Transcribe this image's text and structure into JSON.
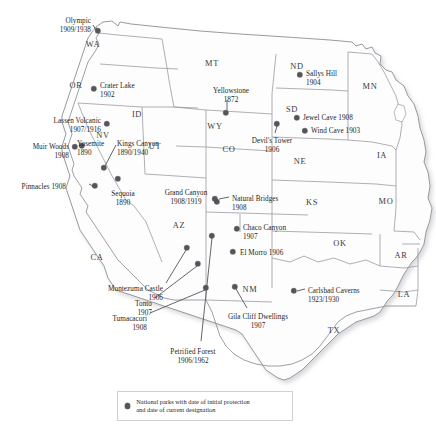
{
  "map": {
    "title": "National parks with date of initial protection and date of current designation",
    "colors": {
      "dot": "#55545a",
      "state_border": "#9a9aa2",
      "coast": "#8e8e96",
      "shadow": "#d8d8dc",
      "land": "#fdfdfd",
      "text": "#221f26"
    }
  },
  "legend": {
    "line1": "National parks with date of initial protection",
    "line2": "and date of current designation",
    "marker": "filled-circle"
  },
  "states": [
    {
      "abbr": "WA",
      "x": 93,
      "y": 44
    },
    {
      "abbr": "OR",
      "x": 76,
      "y": 85
    },
    {
      "abbr": "ID",
      "x": 137,
      "y": 114
    },
    {
      "abbr": "MT",
      "x": 212,
      "y": 63
    },
    {
      "abbr": "ND",
      "x": 297,
      "y": 66
    },
    {
      "abbr": "MN",
      "x": 370,
      "y": 86
    },
    {
      "abbr": "SD",
      "x": 292,
      "y": 109
    },
    {
      "abbr": "WY",
      "x": 215,
      "y": 126
    },
    {
      "abbr": "NV",
      "x": 103,
      "y": 135
    },
    {
      "abbr": "NE",
      "x": 300,
      "y": 161
    },
    {
      "abbr": "IA",
      "x": 382,
      "y": 155
    },
    {
      "abbr": "UT",
      "x": 155,
      "y": 146
    },
    {
      "abbr": "CO",
      "x": 229,
      "y": 149
    },
    {
      "abbr": "KS",
      "x": 312,
      "y": 202
    },
    {
      "abbr": "MO",
      "x": 386,
      "y": 201
    },
    {
      "abbr": "AZ",
      "x": 179,
      "y": 225
    },
    {
      "abbr": "CA",
      "x": 97,
      "y": 257
    },
    {
      "abbr": "OK",
      "x": 340,
      "y": 243
    },
    {
      "abbr": "AR",
      "x": 401,
      "y": 255
    },
    {
      "abbr": "NM",
      "x": 250,
      "y": 289
    },
    {
      "abbr": "LA",
      "x": 404,
      "y": 294
    },
    {
      "abbr": "TX",
      "x": 334,
      "y": 330
    }
  ],
  "parks": [
    {
      "name": "Olympic",
      "dates": "1909/1938",
      "dot": {
        "x": 98,
        "y": 31
      },
      "label": {
        "x": 91,
        "y": 17,
        "align": "right"
      }
    },
    {
      "name": "Crater Lake",
      "dates": "1902",
      "dot": {
        "x": 94,
        "y": 89
      },
      "label": {
        "x": 100,
        "y": 82,
        "align": "left"
      }
    },
    {
      "name": "Lassen Volcanic",
      "dates": "1907/1916",
      "dot": {
        "x": 107,
        "y": 124
      },
      "label": {
        "x": 101,
        "y": 117,
        "align": "right"
      }
    },
    {
      "name": "Yosemite",
      "dates": "1890",
      "dot": {
        "x": 82,
        "y": 146
      },
      "label": {
        "x": 77,
        "y": 140,
        "align": "left"
      }
    },
    {
      "name": "Muir Woods",
      "dates": "1908",
      "dot": {
        "x": 75,
        "y": 147
      },
      "label": {
        "x": 69,
        "y": 143,
        "align": "right"
      }
    },
    {
      "name": "Kings Canyon",
      "dates": "1890/1940",
      "dot": {
        "x": 104,
        "y": 168
      },
      "label": {
        "x": 117,
        "y": 140,
        "align": "left"
      }
    },
    {
      "name": "Pinnacles",
      "dates": "1908",
      "dot": {
        "x": 95,
        "y": 186
      },
      "label": {
        "x": 66,
        "y": 183,
        "align": "right"
      }
    },
    {
      "name": "Sequoia",
      "dates": "1890",
      "dot": {
        "x": 118,
        "y": 179
      },
      "label": {
        "x": 123,
        "y": 190,
        "align": "center"
      }
    },
    {
      "name": "Yellowstone",
      "dates": "1872",
      "dot": {
        "x": 226,
        "y": 113
      },
      "label": {
        "x": 231,
        "y": 87,
        "align": "center"
      }
    },
    {
      "name": "Devil's Tower",
      "dates": "1906",
      "dot": {
        "x": 277,
        "y": 124
      },
      "label": {
        "x": 272,
        "y": 137,
        "align": "center"
      }
    },
    {
      "name": "Sallys Hill",
      "dates": "1904",
      "dot": {
        "x": 300,
        "y": 75
      },
      "label": {
        "x": 306,
        "y": 70,
        "align": "left"
      }
    },
    {
      "name": "Jewel Cave",
      "dates": "1908",
      "dot": {
        "x": 297,
        "y": 118
      },
      "label": {
        "x": 303,
        "y": 114,
        "align": "left"
      }
    },
    {
      "name": "Wind Cave",
      "dates": "1903",
      "dot": {
        "x": 305,
        "y": 131
      },
      "label": {
        "x": 311,
        "y": 127,
        "align": "left"
      }
    },
    {
      "name": "Grand Canyon",
      "dates": "1908/1919",
      "dot": {
        "x": 217,
        "y": 202
      },
      "label": {
        "x": 186,
        "y": 189,
        "align": "center"
      }
    },
    {
      "name": "Natural Bridges",
      "dates": "1908",
      "dot": {
        "x": 215,
        "y": 199
      },
      "label": {
        "x": 232,
        "y": 195,
        "align": "left"
      }
    },
    {
      "name": "Chaco Canyon",
      "dates": "1907",
      "dot": {
        "x": 237,
        "y": 229
      },
      "label": {
        "x": 243,
        "y": 224,
        "align": "left"
      }
    },
    {
      "name": "El Morro",
      "dates": "1906",
      "dot": {
        "x": 233,
        "y": 252
      },
      "label": {
        "x": 240,
        "y": 249,
        "align": "left"
      }
    },
    {
      "name": "Carlsbad Caverns",
      "dates": "1923/1930",
      "dot": {
        "x": 294,
        "y": 291
      },
      "label": {
        "x": 308,
        "y": 287,
        "align": "left"
      }
    },
    {
      "name": "Montezuma Castle",
      "dates": "1906",
      "dot": {
        "x": 187,
        "y": 248
      },
      "label": {
        "x": 163,
        "y": 285,
        "align": "right"
      }
    },
    {
      "name": "Tonto",
      "dates": "1907",
      "dot": {
        "x": 198,
        "y": 264
      },
      "label": {
        "x": 152,
        "y": 300,
        "align": "right"
      }
    },
    {
      "name": "Tumacacori",
      "dates": "1908",
      "dot": {
        "x": 206,
        "y": 288
      },
      "label": {
        "x": 147,
        "y": 315,
        "align": "right"
      }
    },
    {
      "name": "Gila Cliff Dwellings",
      "dates": "1907",
      "dot": {
        "x": 235,
        "y": 287
      },
      "label": {
        "x": 258,
        "y": 313,
        "align": "center"
      }
    },
    {
      "name": "Petrified Forest",
      "dates": "1906/1962",
      "dot": {
        "x": 212,
        "y": 236
      },
      "label": {
        "x": 193,
        "y": 348,
        "align": "center"
      }
    }
  ],
  "leaders": [
    {
      "from": "Olympic-label",
      "x1": 93,
      "y1": 25,
      "x2": 96,
      "y2": 30
    },
    {
      "from": "Yellowstone-label",
      "x1": 227,
      "y1": 100,
      "x2": 227,
      "y2": 110
    },
    {
      "from": "DevilsTower-label",
      "x1": 275,
      "y1": 133,
      "x2": 277,
      "y2": 126
    },
    {
      "from": "KingsCanyon-label",
      "x1": 116,
      "y1": 145,
      "x2": 105,
      "y2": 166
    },
    {
      "from": "Pinnacles-label",
      "x1": 89,
      "y1": 184,
      "x2": 93,
      "y2": 186
    },
    {
      "from": "NaturalBridges-lbl",
      "x1": 229,
      "y1": 197,
      "x2": 219,
      "y2": 199
    },
    {
      "from": "Carlsbad-label",
      "x1": 305,
      "y1": 289,
      "x2": 297,
      "y2": 291
    },
    {
      "from": "Montezuma-label",
      "x1": 166,
      "y1": 283,
      "x2": 186,
      "y2": 250
    },
    {
      "from": "Tonto-label",
      "x1": 155,
      "y1": 298,
      "x2": 197,
      "y2": 266
    },
    {
      "from": "Tumacacori-label",
      "x1": 150,
      "y1": 313,
      "x2": 205,
      "y2": 290
    },
    {
      "from": "GilaCliff-label",
      "x1": 247,
      "y1": 308,
      "x2": 236,
      "y2": 289
    },
    {
      "from": "Petrified-label",
      "x1": 201,
      "y1": 341,
      "x2": 212,
      "y2": 238
    }
  ]
}
